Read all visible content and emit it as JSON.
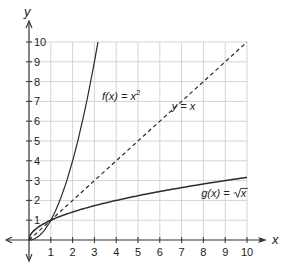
{
  "chart_data": {
    "type": "line",
    "title": "",
    "xlabel": "x",
    "ylabel": "y",
    "xlim": [
      0,
      10
    ],
    "ylim": [
      0,
      10
    ],
    "grid": true,
    "x_ticks": [
      "1",
      "2",
      "3",
      "4",
      "5",
      "6",
      "7",
      "8",
      "9",
      "10"
    ],
    "y_ticks": [
      "1",
      "2",
      "3",
      "4",
      "5",
      "6",
      "7",
      "8",
      "9",
      "10"
    ],
    "series": [
      {
        "name": "f(x) = x^2",
        "style": "solid",
        "x": [
          0,
          0.5,
          1,
          1.5,
          2,
          2.5,
          3,
          3.16
        ],
        "values": [
          0,
          0.25,
          1,
          2.25,
          4,
          6.25,
          9,
          10
        ]
      },
      {
        "name": "y = x",
        "style": "dashed",
        "x": [
          0,
          10
        ],
        "values": [
          0,
          10
        ]
      },
      {
        "name": "g(x) = sqrt(x)",
        "style": "solid",
        "x": [
          0,
          0.25,
          1,
          2,
          4,
          6,
          8,
          10
        ],
        "values": [
          0,
          0.5,
          1,
          1.41,
          2,
          2.45,
          2.83,
          3.16
        ]
      }
    ],
    "annotations": [
      {
        "text_main": "f(x) = x",
        "sup": "2",
        "x": 3.3,
        "y": 7.2
      },
      {
        "text": "y = x",
        "x": 6.4,
        "y": 6.6
      },
      {
        "text_main": "g(x) = ",
        "radicand": "x",
        "x": 7.9,
        "y": 2.3
      }
    ],
    "colors": {
      "curve": "#2a2a2a",
      "grid": "#d4d4d4",
      "axis": "#333333"
    }
  },
  "axes": {
    "x_label": "x",
    "y_label": "y"
  },
  "labels": {
    "f_prefix": "f(x) = x",
    "f_sup": "2",
    "identity": "y = x",
    "g_prefix": "g(x) = ",
    "g_radicand": "x"
  }
}
